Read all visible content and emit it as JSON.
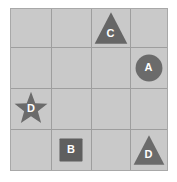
{
  "board": {
    "name": "shape-grid-puzzle",
    "rows": 4,
    "cols": 4,
    "cell_background": "#c9c9c9",
    "grid_line_color": "#9e9e9e",
    "border_color": "#a8a8a8",
    "page_background": "#ffffff"
  },
  "shapes": [
    {
      "id": "shape-c",
      "label": "C",
      "shape": "triangle",
      "row": 1,
      "col": 3,
      "color": "#666666",
      "label_color": "#ffffff",
      "size": 34
    },
    {
      "id": "shape-a",
      "label": "A",
      "shape": "circle",
      "row": 2,
      "col": 4,
      "color": "#6b6b6b",
      "label_color": "#ffffff",
      "size": 28
    },
    {
      "id": "shape-d-star",
      "label": "D",
      "shape": "star",
      "row": 3,
      "col": 1,
      "color": "#6b6b6b",
      "label_color": "#ffffff",
      "size": 36
    },
    {
      "id": "shape-b",
      "label": "B",
      "shape": "square",
      "row": 4,
      "col": 2,
      "color": "#5f5f5f",
      "label_color": "#ffffff",
      "size": 24
    },
    {
      "id": "shape-d-triangle",
      "label": "D",
      "shape": "triangle",
      "row": 4,
      "col": 4,
      "color": "#6b6b6b",
      "label_color": "#ffffff",
      "size": 32
    }
  ]
}
